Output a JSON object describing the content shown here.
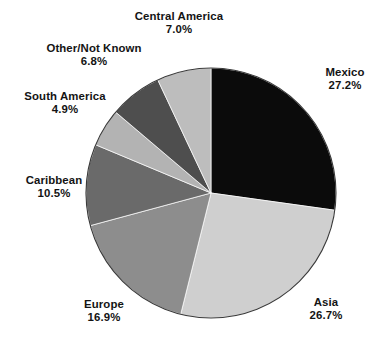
{
  "chart_data": {
    "type": "pie",
    "title": "",
    "subtitle": "",
    "xlabel": "",
    "ylabel": "",
    "legend_position": "none",
    "grid": false,
    "start_angle_deg": 0,
    "direction": "clockwise",
    "units": "percent",
    "categories": [
      "Mexico",
      "Asia",
      "Europe",
      "Caribbean",
      "South America",
      "Other/Not Known",
      "Central America"
    ],
    "values": [
      27.2,
      26.7,
      16.9,
      10.5,
      4.9,
      6.8,
      7.0
    ],
    "value_labels": [
      "27.2%",
      "26.7%",
      "16.9%",
      "10.5%",
      "4.9%",
      "6.8%",
      "7.0%"
    ],
    "colors": [
      "#0b0b0b",
      "#cfcfcf",
      "#8d8d8d",
      "#6a6a6a",
      "#b3b3b3",
      "#4e4e4e",
      "#bdbdbd"
    ],
    "slices": [
      {
        "name": "Mexico",
        "value": 27.2,
        "value_label": "27.2%",
        "color": "#0b0b0b",
        "label_pos": "right"
      },
      {
        "name": "Asia",
        "value": 26.7,
        "value_label": "26.7%",
        "color": "#cfcfcf",
        "label_pos": "bottom-right"
      },
      {
        "name": "Europe",
        "value": 16.9,
        "value_label": "16.9%",
        "color": "#8d8d8d",
        "label_pos": "bottom-left"
      },
      {
        "name": "Caribbean",
        "value": 10.5,
        "value_label": "10.5%",
        "color": "#6a6a6a",
        "label_pos": "left"
      },
      {
        "name": "South America",
        "value": 4.9,
        "value_label": "4.9%",
        "color": "#b3b3b3",
        "label_pos": "upper-left"
      },
      {
        "name": "Other/Not Known",
        "value": 6.8,
        "value_label": "6.8%",
        "color": "#4e4e4e",
        "label_pos": "upper-left"
      },
      {
        "name": "Central America",
        "value": 7.0,
        "value_label": "7.0%",
        "color": "#bdbdbd",
        "label_pos": "top"
      }
    ]
  },
  "figure": {
    "background": "#ffffff",
    "text_color": "#141414",
    "outline_color": "#3a3a3a",
    "center_x": 211,
    "center_y": 193,
    "radius": 125
  }
}
